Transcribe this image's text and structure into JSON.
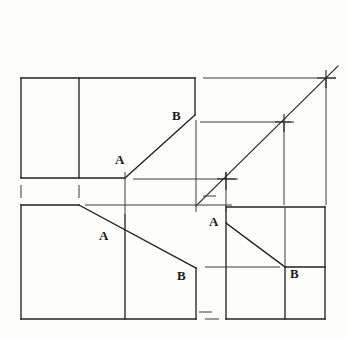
{
  "drawing": {
    "title": "Orthographic third-angle projection exercise",
    "background_color": "#fdfdfb",
    "line_color": "#222222",
    "construction_color": "#4a4a4a",
    "labels": [
      {
        "id": "top-view-B",
        "text": "B",
        "x": 172,
        "y": 109
      },
      {
        "id": "top-view-A",
        "text": "A",
        "x": 115,
        "y": 153
      },
      {
        "id": "front-view-A",
        "text": "A",
        "x": 99,
        "y": 229
      },
      {
        "id": "front-view-B",
        "text": "B",
        "x": 177,
        "y": 269
      },
      {
        "id": "side-view-A",
        "text": "A",
        "x": 209,
        "y": 215
      },
      {
        "id": "side-view-B",
        "text": "B",
        "x": 290,
        "y": 267
      }
    ],
    "views": {
      "top": {
        "name": "top-view",
        "rect": {
          "x1": 21,
          "y1": 78,
          "x2": 195,
          "y2": 178
        },
        "divider_x": 79,
        "edge_A": {
          "x": 125,
          "y": 178
        },
        "edge_B": {
          "x": 195,
          "y": 115
        }
      },
      "front": {
        "name": "front-view",
        "rect": {
          "x1": 21,
          "y1": 205,
          "x2": 196,
          "y2": 319
        },
        "divider_x": 125,
        "slope_start": {
          "x": 79,
          "y": 205
        },
        "edge_B": {
          "x": 196,
          "y": 268
        }
      },
      "side": {
        "name": "side-view",
        "rect": {
          "x1": 226,
          "y1": 207,
          "x2": 325,
          "y2": 319
        },
        "divider_x": 285,
        "edge_A": {
          "x": 226,
          "y": 223
        },
        "corner": {
          "x": 285,
          "y": 267
        }
      }
    },
    "miter": {
      "name": "45-degree-miter-line",
      "x1": 196,
      "y1": 206,
      "x2": 338,
      "y2": 66,
      "crossings": [
        {
          "id": "miter-crossing-lower",
          "x": 226,
          "y": 179
        },
        {
          "id": "miter-crossing-middle",
          "x": 284,
          "y": 122
        },
        {
          "id": "miter-crossing-upper",
          "x": 326,
          "y": 78
        }
      ]
    },
    "projection_lines": {
      "horizontal": [
        {
          "id": "proj-h-top",
          "x1": 203,
          "y1": 78,
          "x2": 336,
          "y2": 78
        },
        {
          "id": "proj-h-mid",
          "x1": 200,
          "y1": 122,
          "x2": 291,
          "y2": 122
        },
        {
          "id": "proj-h-low",
          "x1": 133,
          "y1": 179,
          "x2": 238,
          "y2": 179
        },
        {
          "id": "proj-h-base",
          "x1": 85,
          "y1": 205,
          "x2": 232,
          "y2": 205
        },
        {
          "id": "proj-h-side",
          "x1": 205,
          "y1": 267,
          "x2": 280,
          "y2": 267
        }
      ],
      "vertical": [
        {
          "id": "proj-v-right",
          "x1": 326,
          "y1": 78,
          "x2": 326,
          "y2": 205
        },
        {
          "id": "proj-v-mid",
          "x1": 284,
          "y1": 122,
          "x2": 284,
          "y2": 205
        },
        {
          "id": "proj-v-inner",
          "x1": 226,
          "y1": 172,
          "x2": 226,
          "y2": 212
        },
        {
          "id": "proj-v-top-edge",
          "x1": 196,
          "y1": 120,
          "x2": 196,
          "y2": 212
        },
        {
          "id": "proj-v-front-div",
          "x1": 125,
          "y1": 172,
          "x2": 125,
          "y2": 212
        }
      ],
      "dashes": [
        {
          "id": "dash-left-gap",
          "x1": 21,
          "y1": 184,
          "x2": 21,
          "y2": 198
        },
        {
          "id": "dash-div-gap",
          "x1": 79,
          "y1": 184,
          "x2": 79,
          "y2": 198
        },
        {
          "id": "dash-right-gap",
          "x1": 196,
          "y1": 312,
          "x2": 208,
          "y2": 312
        },
        {
          "id": "dash-side-gap",
          "x1": 205,
          "y1": 319,
          "x2": 218,
          "y2": 319
        }
      ]
    }
  }
}
